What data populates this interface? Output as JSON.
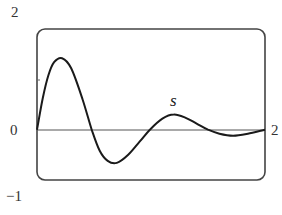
{
  "chart_data": {
    "type": "line",
    "title": "",
    "xlabel": "",
    "ylabel": "",
    "xlim": [
      0,
      2
    ],
    "ylim": [
      -1,
      2
    ],
    "grid": false,
    "legend": null,
    "tick_labels": {
      "y_top": "2",
      "y_zero": "0",
      "y_bottom": "−1",
      "x_right": "2"
    },
    "y_minor_ticks": [
      1
    ],
    "annotations": [
      {
        "text": "s",
        "x": 1.2,
        "y": 0.55
      }
    ],
    "series": [
      {
        "name": "s",
        "x": [
          0,
          0.05,
          0.1,
          0.15,
          0.22,
          0.3,
          0.4,
          0.48,
          0.55,
          0.62,
          0.7,
          0.8,
          0.9,
          0.99,
          1.1,
          1.2,
          1.3,
          1.4,
          1.5,
          1.6,
          1.72,
          1.85,
          2.0
        ],
        "values": [
          0,
          0.62,
          1.08,
          1.34,
          1.42,
          1.22,
          0.6,
          0,
          -0.42,
          -0.62,
          -0.66,
          -0.5,
          -0.24,
          0,
          0.22,
          0.3,
          0.24,
          0.12,
          0,
          -0.08,
          -0.12,
          -0.08,
          0
        ]
      }
    ]
  },
  "colors": {
    "curve": "#1a1a1a",
    "frame": "#444444",
    "axis": "#555555"
  }
}
